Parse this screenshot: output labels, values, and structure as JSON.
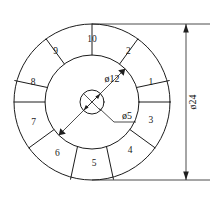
{
  "drawing": {
    "title": "Circular plate with 10 numbered sectors",
    "background_color": "#ffffff",
    "line_color": "#1c1c1c",
    "geometry": {
      "center_x": 92,
      "center_y": 102,
      "outer_radius": 78,
      "middle_radius": 47,
      "hub_radius": 12
    },
    "sectors": [
      {
        "label": "1",
        "angle_deg": 342,
        "label_radius": 62
      },
      {
        "label": "2",
        "angle_deg": 306,
        "label_radius": 62
      },
      {
        "label": "3",
        "angle_deg": 18,
        "label_radius": 62
      },
      {
        "label": "4",
        "angle_deg": 52,
        "label_radius": 62
      },
      {
        "label": "5",
        "angle_deg": 88,
        "label_radius": 62
      },
      {
        "label": "6",
        "angle_deg": 124,
        "label_radius": 62
      },
      {
        "label": "7",
        "angle_deg": 160,
        "label_radius": 62
      },
      {
        "label": "8",
        "angle_deg": 198,
        "label_radius": 62
      },
      {
        "label": "9",
        "angle_deg": 234,
        "label_radius": 62
      },
      {
        "label": "10",
        "angle_deg": 270,
        "label_radius": 62
      }
    ],
    "dimensions": {
      "outer_diameter": {
        "label": "ø24",
        "orientation": "vertical",
        "line_x": 186,
        "top_y": 24,
        "bottom_y": 180,
        "text_x": 192,
        "text_y": 102
      },
      "middle_diameter": {
        "label": "ø12",
        "orientation": "diagonal",
        "text_x": 112,
        "text_y": 80
      },
      "hub_diameter": {
        "label": "ø5",
        "orientation": "leader",
        "text_x": 127,
        "text_y": 117
      }
    }
  }
}
